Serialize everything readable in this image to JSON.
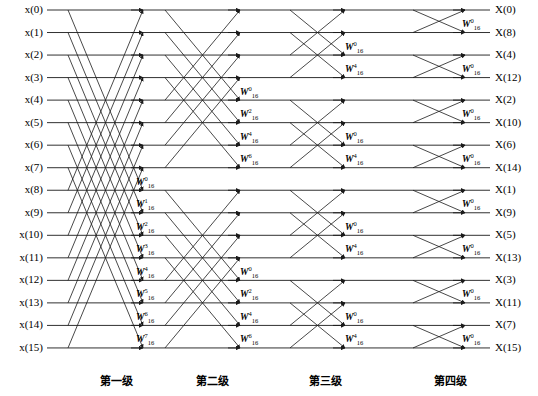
{
  "diagram": {
    "line_color": "#1a1a1a",
    "text_color": "#000000",
    "background": "#ffffff",
    "n_points": 16,
    "n_stages": 4
  },
  "inputs": [
    "x(0)",
    "x(1)",
    "x(2)",
    "x(3)",
    "x(4)",
    "x(5)",
    "x(6)",
    "x(7)",
    "x(8)",
    "x(9)",
    "x(10)",
    "x(11)",
    "x(12)",
    "x(13)",
    "x(14)",
    "x(15)"
  ],
  "outputs": [
    "X(0)",
    "X(8)",
    "X(4)",
    "X(12)",
    "X(2)",
    "X(10)",
    "X(6)",
    "X(14)",
    "X(1)",
    "X(9)",
    "X(5)",
    "X(13)",
    "X(3)",
    "X(11)",
    "X(7)",
    "X(15)"
  ],
  "stage_labels": [
    "第一级",
    "第二级",
    "第三级",
    "第四级"
  ],
  "twiddle": {
    "base": "W",
    "subscript": "16",
    "stage1_exponents": [
      "0",
      "1",
      "2",
      "3",
      "4",
      "5",
      "6",
      "7"
    ],
    "stage2_exponents": [
      "0",
      "2",
      "4",
      "6",
      "0",
      "2",
      "4",
      "6"
    ],
    "stage3_exponents": [
      "0",
      "4",
      "0",
      "4",
      "0",
      "4",
      "0",
      "4"
    ],
    "stage4_exponents": [
      "0",
      "0",
      "0",
      "0",
      "0",
      "0",
      "0",
      "0"
    ]
  },
  "chart_data": {
    "type": "diagram",
    "rows": 16,
    "row_y_start": 10,
    "row_spacing": 22.53,
    "stages": [
      {
        "index": 1,
        "label": "第一级",
        "span": 8,
        "x_start": 68,
        "x_end": 143,
        "label_x": 136,
        "twiddles": [
          "0",
          "1",
          "2",
          "3",
          "4",
          "5",
          "6",
          "7"
        ],
        "twiddle_rows": [
          8,
          9,
          10,
          11,
          12,
          13,
          14,
          15
        ]
      },
      {
        "index": 2,
        "label": "第二级",
        "span": 4,
        "x_start": 165,
        "x_end": 240,
        "label_x": 240,
        "twiddles": [
          "0",
          "2",
          "4",
          "6",
          "0",
          "2",
          "4",
          "6"
        ],
        "twiddle_rows": [
          4,
          5,
          6,
          7,
          12,
          13,
          14,
          15
        ]
      },
      {
        "index": 3,
        "label": "第三级",
        "span": 2,
        "x_start": 290,
        "x_end": 345,
        "label_x": 345,
        "twiddles": [
          "0",
          "4",
          "0",
          "4",
          "0",
          "4",
          "0",
          "4"
        ],
        "twiddle_rows": [
          2,
          3,
          6,
          7,
          10,
          11,
          14,
          15
        ]
      },
      {
        "index": 4,
        "label": "第四级",
        "span": 1,
        "x_start": 413,
        "x_end": 465,
        "label_x": 462,
        "twiddles": [
          "0",
          "0",
          "0",
          "0",
          "0",
          "0",
          "0",
          "0"
        ],
        "twiddle_rows": [
          1,
          3,
          5,
          7,
          9,
          11,
          13,
          15
        ]
      }
    ],
    "xlabel": "",
    "ylabel": "",
    "grid": false,
    "legend": "none"
  }
}
